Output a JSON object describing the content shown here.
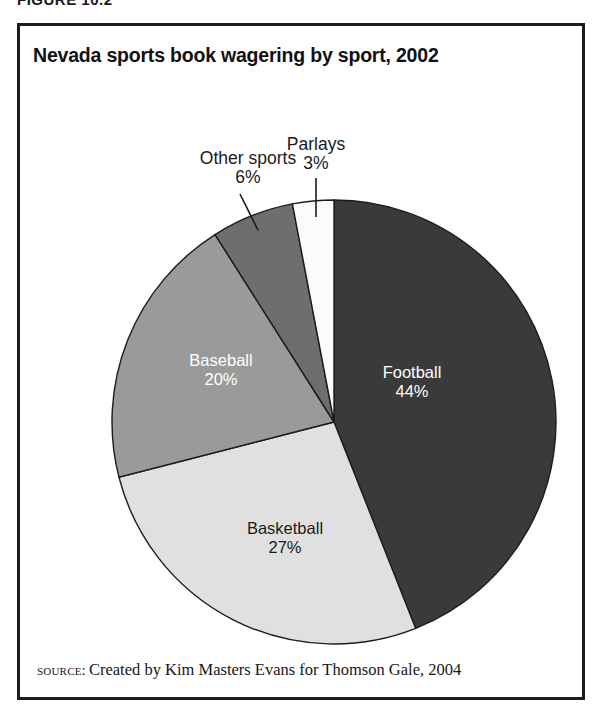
{
  "figure": {
    "caption": "FIGURE 10.2"
  },
  "chart_title": "Nevada sports book wagering by sport, 2002",
  "source": {
    "label": "source:",
    "text": "Created by Kim Masters Evans for Thomson Gale, 2004"
  },
  "chart_data": {
    "type": "pie",
    "title": "Nevada sports book wagering by sport, 2002",
    "categories": [
      "Football",
      "Basketball",
      "Baseball",
      "Other sports",
      "Parlays"
    ],
    "values": [
      44,
      27,
      20,
      6,
      3
    ],
    "unit": "%",
    "start_angle_deg": 0,
    "direction": "clockwise",
    "legend": "none",
    "labels": [
      {
        "name": "Football",
        "value": 44,
        "value_text": "44%",
        "placement": "inside",
        "fill": "#3a3a3a",
        "text_color": "#ffffff",
        "label_x": 412,
        "label_y": 378
      },
      {
        "name": "Basketball",
        "value": 27,
        "value_text": "27%",
        "placement": "inside",
        "fill": "#e0e0e0",
        "text_color": "#1b1b1b",
        "label_x": 285,
        "label_y": 534
      },
      {
        "name": "Baseball",
        "value": 20,
        "value_text": "20%",
        "placement": "inside",
        "fill": "#9a9a9a",
        "text_color": "#ffffff",
        "label_x": 221,
        "label_y": 366
      },
      {
        "name": "Other sports",
        "value": 6,
        "value_text": "6%",
        "placement": "outside",
        "fill": "#6e6e6e",
        "text_color": "#1b1b1b",
        "label_x": 248,
        "label_y": 164
      },
      {
        "name": "Parlays",
        "value": 3,
        "value_text": "3%",
        "placement": "outside",
        "fill": "#fbfbfb",
        "text_color": "#1b1b1b",
        "label_x": 316,
        "label_y": 150
      }
    ],
    "geometry": {
      "cx": 334,
      "cy": 422,
      "r": 222
    }
  }
}
